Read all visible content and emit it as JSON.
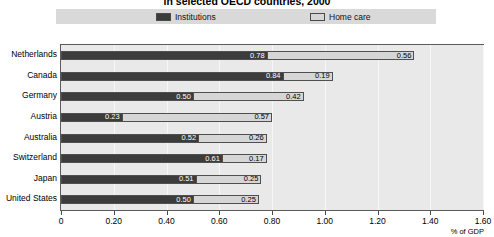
{
  "chart_data": {
    "type": "bar",
    "orientation": "horizontal",
    "stacked": true,
    "title": "in selected OECD countries, 2000",
    "xlabel": "% of GDP",
    "ylabel": "",
    "xlim": [
      0,
      1.6
    ],
    "xticks": [
      "0",
      "0.20",
      "0.40",
      "0.60",
      "0.80",
      "1.00",
      "1.20",
      "1.40",
      "1.60"
    ],
    "xtick_values": [
      0,
      0.2,
      0.4,
      0.6,
      0.8,
      1.0,
      1.2,
      1.4,
      1.6
    ],
    "grid": true,
    "legend_position": "top",
    "categories": [
      "Netherlands",
      "Canada",
      "Germany",
      "Austria",
      "Australia",
      "Switzerland",
      "Japan",
      "United States"
    ],
    "series": [
      {
        "name": "Institutions",
        "color": "#3c3c3c",
        "values": [
          0.78,
          0.84,
          0.5,
          0.23,
          0.52,
          0.61,
          0.51,
          0.5
        ],
        "labels": [
          "0.78",
          "0.84",
          "0.50",
          "0.23",
          "0.52",
          "0.61",
          "0.51",
          "0.50"
        ]
      },
      {
        "name": "Home care",
        "color": "#d6d6d6",
        "values": [
          0.56,
          0.19,
          0.42,
          0.57,
          0.26,
          0.17,
          0.25,
          0.25
        ],
        "labels": [
          "0.56",
          "0.19",
          "0.42",
          "0.57",
          "0.26",
          "0.17",
          "0.25",
          "0.25"
        ]
      }
    ]
  },
  "legend": {
    "items": [
      {
        "label": "Institutions",
        "color": "#3c3c3c"
      },
      {
        "label": "Home care",
        "color": "#d6d6d6"
      }
    ]
  }
}
